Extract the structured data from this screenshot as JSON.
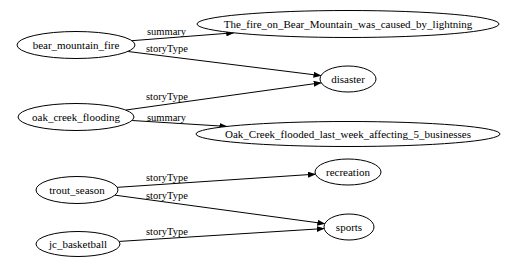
{
  "colors": {
    "background": "#ffffff",
    "stroke": "#000000",
    "text": "#000000"
  },
  "diagram": {
    "type": "graph",
    "direction": "LR",
    "nodes": [
      {
        "id": "bear_mountain_fire",
        "label": "bear_mountain_fire",
        "cx": 76,
        "cy": 45,
        "rx": 59,
        "ry": 13.5
      },
      {
        "id": "fire_summary",
        "label": "The_fire_on_Bear_Mountain_was_caused_by_lightning",
        "cx": 348,
        "cy": 24,
        "rx": 151,
        "ry": 13.5
      },
      {
        "id": "disaster",
        "label": "disaster",
        "cx": 348,
        "cy": 79,
        "rx": 28,
        "ry": 13
      },
      {
        "id": "oak_creek_flooding",
        "label": "oak_creek_flooding",
        "cx": 76,
        "cy": 117,
        "rx": 58,
        "ry": 13.5
      },
      {
        "id": "flood_summary",
        "label": "Oak_Creek_flooded_last_week_affecting_5_businesses",
        "cx": 348,
        "cy": 134,
        "rx": 152,
        "ry": 12.5
      },
      {
        "id": "trout_season",
        "label": "trout_season",
        "cx": 77,
        "cy": 190,
        "rx": 41,
        "ry": 13.5
      },
      {
        "id": "recreation",
        "label": "recreation",
        "cx": 348,
        "cy": 172,
        "rx": 33,
        "ry": 13
      },
      {
        "id": "sports",
        "label": "sports",
        "cx": 349,
        "cy": 227,
        "rx": 25,
        "ry": 13
      },
      {
        "id": "jc_basketball",
        "label": "jc_basketball",
        "cx": 78,
        "cy": 244,
        "rx": 42,
        "ry": 12.5
      }
    ],
    "edges": [
      {
        "from": "bear_mountain_fire",
        "to": "fire_summary",
        "label": "summary",
        "label_x": 147,
        "label_y": 35
      },
      {
        "from": "bear_mountain_fire",
        "to": "disaster",
        "label": "storyType",
        "label_x": 146,
        "label_y": 52
      },
      {
        "from": "oak_creek_flooding",
        "to": "disaster",
        "label": "storyType",
        "label_x": 146,
        "label_y": 100
      },
      {
        "from": "oak_creek_flooding",
        "to": "flood_summary",
        "label": "summary",
        "label_x": 147,
        "label_y": 121
      },
      {
        "from": "trout_season",
        "to": "recreation",
        "label": "storyType",
        "label_x": 146,
        "label_y": 181
      },
      {
        "from": "trout_season",
        "to": "sports",
        "label": "storyType",
        "label_x": 146,
        "label_y": 199
      },
      {
        "from": "jc_basketball",
        "to": "sports",
        "label": "storyType",
        "label_x": 146,
        "label_y": 235
      }
    ]
  }
}
